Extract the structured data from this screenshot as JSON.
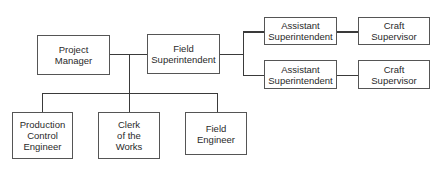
{
  "diagram": {
    "type": "organization-chart",
    "nodes": {
      "project_manager": "Project\nManager",
      "field_superintendent": "Field\nSuperintendent",
      "assistant_superintendent_1": "Assistant\nSuperintendent",
      "assistant_superintendent_2": "Assistant\nSuperintendent",
      "craft_supervisor_1": "Craft\nSupervisor",
      "craft_supervisor_2": "Craft\nSupervisor",
      "production_control_engineer": "Production\nControl\nEngineer",
      "clerk_of_the_works": "Clerk\nof the\nWorks",
      "field_engineer": "Field\nEngineer"
    },
    "edges": [
      [
        "project_manager",
        "field_superintendent"
      ],
      [
        "field_superintendent",
        "assistant_superintendent_1"
      ],
      [
        "field_superintendent",
        "assistant_superintendent_2"
      ],
      [
        "assistant_superintendent_1",
        "craft_supervisor_1"
      ],
      [
        "assistant_superintendent_2",
        "craft_supervisor_2"
      ],
      [
        "project_manager",
        "production_control_engineer"
      ],
      [
        "project_manager",
        "clerk_of_the_works"
      ],
      [
        "project_manager",
        "field_engineer"
      ]
    ],
    "colors": {
      "line": "#3a3a3a",
      "border": "#555555",
      "background": "#ffffff"
    }
  }
}
